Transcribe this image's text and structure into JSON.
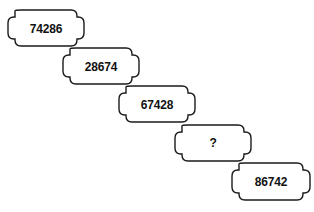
{
  "puzzle": {
    "type": "number-sequence-plaques",
    "background_color": "#ffffff",
    "stroke_color": "#1a1a1a",
    "fill_color": "#ffffff",
    "text_color": "#111111",
    "plaques": [
      {
        "id": "plaque-1",
        "label": "74286",
        "is_unknown": false,
        "x": 8,
        "y": 10,
        "width": 76,
        "height": 36
      },
      {
        "id": "plaque-2",
        "label": "28674",
        "is_unknown": false,
        "x": 63,
        "y": 48,
        "width": 76,
        "height": 36
      },
      {
        "id": "plaque-3",
        "label": "67428",
        "is_unknown": false,
        "x": 119,
        "y": 86,
        "width": 76,
        "height": 36
      },
      {
        "id": "plaque-4",
        "label": "?",
        "is_unknown": true,
        "x": 175,
        "y": 125,
        "width": 76,
        "height": 36
      },
      {
        "id": "plaque-5",
        "label": "86742",
        "is_unknown": false,
        "x": 232,
        "y": 163,
        "width": 78,
        "height": 37
      }
    ]
  }
}
